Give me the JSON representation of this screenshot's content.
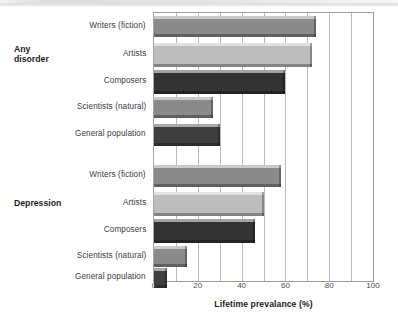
{
  "chart_data": {
    "type": "bar",
    "orientation": "horizontal",
    "title": "",
    "xlabel": "Lifetime prevalance (%)",
    "ylabel": "",
    "xlim": [
      0,
      100
    ],
    "xticks": [
      0,
      20,
      40,
      60,
      80,
      100
    ],
    "xtick_labels": [
      "0",
      "20",
      "40",
      "60",
      "80",
      "100"
    ],
    "minor_gridline_step": 10,
    "grid": true,
    "legend": "none",
    "categories": [
      "Writers (fiction)",
      "Artists",
      "Composers",
      "Scientists (natural)",
      "General population"
    ],
    "groups": [
      {
        "name": "Any disorder",
        "label_lines": [
          "Any",
          "disorder"
        ],
        "values": [
          74,
          72,
          60,
          27,
          30
        ]
      },
      {
        "name": "Depression",
        "label_lines": [
          "Depression"
        ],
        "values": [
          58,
          50,
          46,
          15,
          6
        ]
      }
    ],
    "bar_colors": [
      "#8a8a8a",
      "#bdbdbd",
      "#333333",
      "#8a8a8a",
      "#3f3f3f"
    ]
  },
  "rows": [
    {
      "label": "Writers (fiction)",
      "value": 74,
      "color": "#8a8a8a",
      "group": "Any disorder"
    },
    {
      "label": "Artists",
      "value": 72,
      "color": "#bdbdbd",
      "group": "Any disorder"
    },
    {
      "label": "Composers",
      "value": 60,
      "color": "#333333",
      "group": "Any disorder"
    },
    {
      "label": "Scientists (natural)",
      "value": 27,
      "color": "#8a8a8a",
      "group": "Any disorder"
    },
    {
      "label": "General population",
      "value": 30,
      "color": "#3f3f3f",
      "group": "Any disorder"
    },
    {
      "label": "Writers (fiction)",
      "value": 58,
      "color": "#8a8a8a",
      "group": "Depression"
    },
    {
      "label": "Artists",
      "value": 50,
      "color": "#bdbdbd",
      "group": "Depression"
    },
    {
      "label": "Composers",
      "value": 46,
      "color": "#333333",
      "group": "Depression"
    },
    {
      "label": "Scientists (natural)",
      "value": 15,
      "color": "#8a8a8a",
      "group": "Depression"
    },
    {
      "label": "General population",
      "value": 6,
      "color": "#3f3f3f",
      "group": "Depression"
    }
  ],
  "group_labels": {
    "any_disorder_line1": "Any",
    "any_disorder_line2": "disorder",
    "depression": "Depression"
  },
  "axis": {
    "title": "Lifetime prevalance (%)",
    "ticks": [
      "0",
      "20",
      "40",
      "60",
      "80",
      "100"
    ]
  },
  "colors": {
    "axis_line": "#9a9a9a",
    "gridline": "#b9b9b9",
    "label_text": "#3b3b3b",
    "group_text": "#1c1c1c",
    "background": "#ffffff"
  }
}
